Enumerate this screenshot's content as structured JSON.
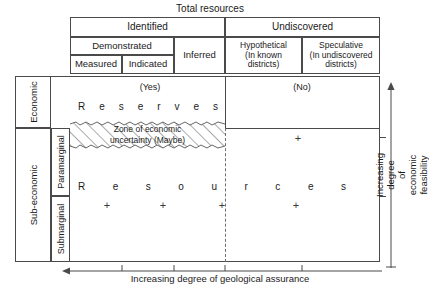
{
  "title": "Total resources",
  "columns": {
    "identified": "Identified",
    "undiscovered": "Undiscovered",
    "demonstrated": "Demonstrated",
    "inferred": "Inferred",
    "measured": "Measured",
    "indicated": "Indicated",
    "hypothetical": "Hypothetical\n(In known\ndistricts)",
    "speculative": "Speculative\n(In undiscovered\ndistricts)"
  },
  "rows": {
    "economic": "Economic",
    "sub_economic": "Sub-economic",
    "paramarginal": "Paramarginal",
    "submarginal": "Submarginal"
  },
  "body": {
    "yes": "(Yes)",
    "no": "(No)",
    "reserves_letters": [
      "R",
      "e",
      "s",
      "e",
      "r",
      "v",
      "e",
      "s"
    ],
    "resources_letters": [
      "R",
      "e",
      "s",
      "o",
      "u",
      "r",
      "c",
      "e",
      "s"
    ],
    "zone_label": "Zone of economic\nuncertainty (Maybe)",
    "plus_mark": "+"
  },
  "axes": {
    "bottom": "Increasing degree of geological assurance",
    "right": "Increasing degree\nof economic feasibility"
  },
  "colors": {
    "line": "#4a4a4a",
    "text": "#1a1a1a",
    "dashed": "#6e6e6e",
    "hatch": "#555555",
    "background": "#ffffff"
  }
}
